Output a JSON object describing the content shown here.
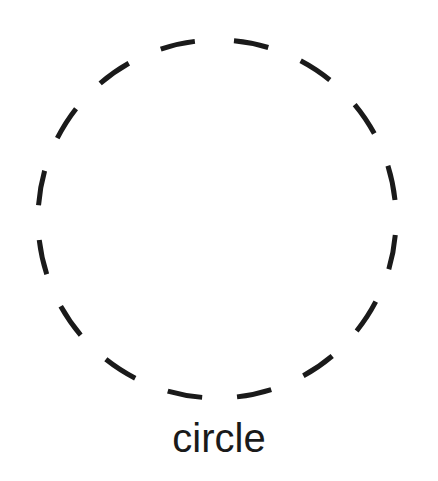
{
  "diagram": {
    "shape": "circle",
    "style": "dashed",
    "stroke_color": "#1a1a1a",
    "label": "circle"
  }
}
